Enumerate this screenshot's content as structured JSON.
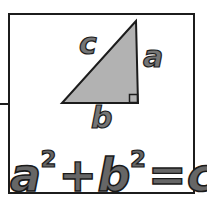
{
  "figure": {
    "triangle": {
      "labels": {
        "hypotenuse": "c",
        "vertical_leg": "a",
        "horizontal_leg": "b"
      },
      "fill_color": "#b2b2b2",
      "outline_color": "#1c1c1c",
      "right_angle_marker": true
    },
    "formula": {
      "text": "a² + b² = c²",
      "terms": [
        {
          "base": "a",
          "exponent": "2"
        },
        {
          "operator": "+"
        },
        {
          "base": "b",
          "exponent": "2"
        },
        {
          "operator": "="
        },
        {
          "base": "c",
          "exponent": "2"
        }
      ]
    },
    "colors": {
      "background": "#ffffff",
      "frame": "#1c1c1c",
      "letter_fill": "#666666",
      "letter_outline": "#1a1a1a"
    }
  }
}
